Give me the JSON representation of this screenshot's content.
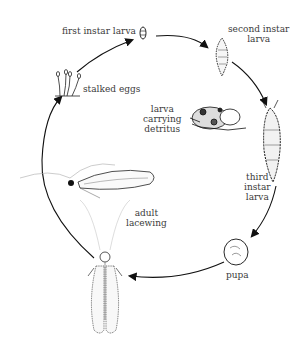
{
  "diagram": {
    "stages": [
      {
        "id": "stalked-eggs",
        "lines": [
          "stalked eggs"
        ]
      },
      {
        "id": "first-instar-larva",
        "lines": [
          "first instar larva"
        ]
      },
      {
        "id": "second-instar-larva",
        "lines": [
          "second instar",
          "larva"
        ]
      },
      {
        "id": "larva-carrying-detritus",
        "lines": [
          "larva",
          "carrying",
          "detritus"
        ]
      },
      {
        "id": "third-instar-larva",
        "lines": [
          "third",
          "instar",
          "larva"
        ]
      },
      {
        "id": "pupa",
        "lines": [
          "pupa"
        ]
      },
      {
        "id": "adult-lacewing",
        "lines": [
          "adult",
          "lacewing"
        ]
      }
    ],
    "cycle_order": [
      "stalked eggs",
      "first instar larva",
      "second instar larva",
      "third instar larva",
      "pupa",
      "adult lacewing"
    ],
    "colors": {
      "line": "#1a1a1a",
      "text": "#3a3a3a",
      "background": "#ffffff"
    }
  }
}
